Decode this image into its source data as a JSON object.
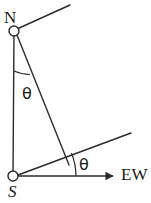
{
  "figure": {
    "type": "geometry-diagram",
    "width": 151,
    "height": 203,
    "background_color": "#ffffff",
    "stroke_color": "#2b2b2b"
  },
  "labels": {
    "north_node": "N",
    "south_node": "S",
    "east_west_axis": "EW",
    "angle_at_north": "θ",
    "angle_at_south": "θ"
  },
  "geometry": {
    "nodes": [
      {
        "name": "N",
        "cx": 14,
        "cy": 31,
        "r": 5
      },
      {
        "name": "S",
        "cx": 13,
        "cy": 176,
        "r": 5
      }
    ],
    "segments": [
      {
        "name": "meridian-NS",
        "x1": 14,
        "y1": 31,
        "x2": 13,
        "y2": 176
      },
      {
        "name": "ray-north-upper",
        "x1": 16,
        "y1": 29,
        "x2": 70,
        "y2": 5
      },
      {
        "name": "transversal-N-to-crossing",
        "x1": 16,
        "y1": 35,
        "x2": 69,
        "y2": 165
      },
      {
        "name": "ray-south-upper",
        "x1": 17,
        "y1": 175,
        "x2": 131,
        "y2": 133
      },
      {
        "name": "axis-EW",
        "x1": 18,
        "y1": 176,
        "x2": 112,
        "y2": 176
      }
    ],
    "arcs": [
      {
        "name": "angle-arc-north",
        "cx": 14,
        "cy": 31,
        "radius": 40
      },
      {
        "name": "angle-arc-south",
        "cx": 13,
        "cy": 176,
        "radius": 63
      }
    ],
    "arrow": {
      "name": "ew-arrowhead",
      "tip_x": 118,
      "tip_y": 176
    }
  }
}
